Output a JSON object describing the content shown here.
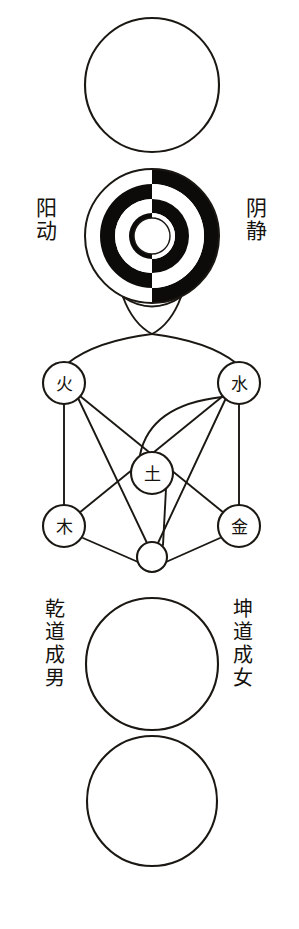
{
  "figure": {
    "background_color": "#ffffff",
    "ink_color": "#1b1713",
    "black_fill": "#0d0b09",
    "white_fill": "#ffffff"
  },
  "sections": {
    "wuji_circle": {
      "name": "empty circle (Wuji / Taiji)",
      "center_x": 152,
      "center_y": 85,
      "radius": 67
    },
    "yinyang_rings": {
      "name": "concentric yin-yang ring circle",
      "center_x": 152,
      "center_y": 236,
      "outer_radius": 67,
      "ring_count": 4,
      "left_half_order_outer_to_inner": [
        "white",
        "black",
        "white",
        "black"
      ],
      "right_half_order_outer_to_inner": [
        "black",
        "white",
        "black",
        "white"
      ],
      "core_circle_radius": 18,
      "core_fill": "white"
    },
    "pendant": {
      "name": "funnel connector below rings",
      "top_y": 300,
      "bottom_y": 333
    },
    "wuxing": {
      "name": "Five Phases network",
      "nodes": [
        {
          "id": "fire",
          "label": "火",
          "cx": 64,
          "cy": 383,
          "r": 21
        },
        {
          "id": "water",
          "label": "水",
          "cx": 239,
          "cy": 383,
          "r": 21
        },
        {
          "id": "earth",
          "label": "土",
          "cx": 152,
          "cy": 473,
          "r": 21
        },
        {
          "id": "wood",
          "label": "木",
          "cx": 64,
          "cy": 526,
          "r": 21
        },
        {
          "id": "metal",
          "label": "金",
          "cx": 239,
          "cy": 526,
          "r": 21
        }
      ],
      "hub": {
        "id": "hub",
        "label": "",
        "cx": 152,
        "cy": 557,
        "r": 15
      },
      "edges": [
        "fire-wood",
        "water-metal",
        "fire-metal",
        "water-wood",
        "water-earth",
        "earth-hub",
        "wood-hub",
        "metal-hub",
        "pendant-fire-arc",
        "pendant-water-arc"
      ]
    },
    "qiankun_circle": {
      "name": "empty circle (Qian forms male / Kun forms female)",
      "center_x": 152,
      "center_y": 664,
      "radius": 66
    },
    "wanwu_circle": {
      "name": "empty circle (myriad things transform and give birth)",
      "center_x": 152,
      "center_y": 801,
      "radius": 65
    }
  },
  "labels": {
    "yang_dong": "阳动",
    "yin_jing": "阴静",
    "qian_dao_cheng_nan": "乾道成男",
    "kun_dao_cheng_nu": "坤道成女"
  },
  "elements": {
    "fire": "火",
    "water": "水",
    "earth": "土",
    "wood": "木",
    "metal": "金"
  }
}
